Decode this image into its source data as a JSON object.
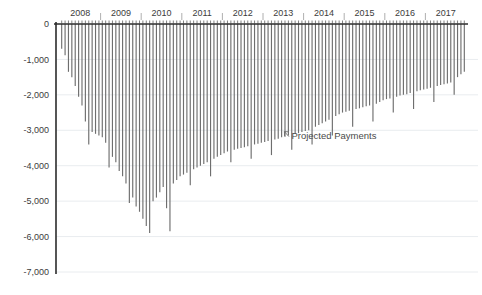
{
  "chart_data": {
    "type": "bar",
    "title": "",
    "subtitle": "",
    "xlabel": "",
    "ylabel": "",
    "orientation": "vertical",
    "grid": true,
    "grid_axis": "y",
    "legend": "none",
    "ylim": [
      -7000,
      0
    ],
    "y_ticks": [
      0,
      -1000,
      -2000,
      -3000,
      -4000,
      -5000,
      -6000,
      -7000
    ],
    "y_tick_labels": [
      "0",
      "-1,000",
      "-2,000",
      "-3,000",
      "-4,000",
      "-5,000",
      "-6,000",
      "-7,000"
    ],
    "x_tick_labels": [
      "2008",
      "2009",
      "2010",
      "2011",
      "2012",
      "2013",
      "2014",
      "2015",
      "2016",
      "2017"
    ],
    "x_minor_ticks_per_year": 12,
    "series_name": "Payments",
    "bar_color": "#7a7a7a",
    "annotations": [
      {
        "text": "Projected Payments",
        "marker": "arrow-up-left",
        "x_value": 2013.6,
        "y_value": -3150
      }
    ],
    "categories": [
      "2008-01",
      "2008-02",
      "2008-03",
      "2008-04",
      "2008-05",
      "2008-06",
      "2008-07",
      "2008-08",
      "2008-09",
      "2008-10",
      "2008-11",
      "2008-12",
      "2009-01",
      "2009-02",
      "2009-03",
      "2009-04",
      "2009-05",
      "2009-06",
      "2009-07",
      "2009-08",
      "2009-09",
      "2009-10",
      "2009-11",
      "2009-12",
      "2010-01",
      "2010-02",
      "2010-03",
      "2010-04",
      "2010-05",
      "2010-06",
      "2010-07",
      "2010-08",
      "2010-09",
      "2010-10",
      "2010-11",
      "2010-12",
      "2011-01",
      "2011-02",
      "2011-03",
      "2011-04",
      "2011-05",
      "2011-06",
      "2011-07",
      "2011-08",
      "2011-09",
      "2011-10",
      "2011-11",
      "2011-12",
      "2012-01",
      "2012-02",
      "2012-03",
      "2012-04",
      "2012-05",
      "2012-06",
      "2012-07",
      "2012-08",
      "2012-09",
      "2012-10",
      "2012-11",
      "2012-12",
      "2013-01",
      "2013-02",
      "2013-03",
      "2013-04",
      "2013-05",
      "2013-06",
      "2013-07",
      "2013-08",
      "2013-09",
      "2013-10",
      "2013-11",
      "2013-12",
      "2014-01",
      "2014-02",
      "2014-03",
      "2014-04",
      "2014-05",
      "2014-06",
      "2014-07",
      "2014-08",
      "2014-09",
      "2014-10",
      "2014-11",
      "2014-12",
      "2015-01",
      "2015-02",
      "2015-03",
      "2015-04",
      "2015-05",
      "2015-06",
      "2015-07",
      "2015-08",
      "2015-09",
      "2015-10",
      "2015-11",
      "2015-12",
      "2016-01",
      "2016-02",
      "2016-03",
      "2016-04",
      "2016-05",
      "2016-06",
      "2016-07",
      "2016-08",
      "2016-09",
      "2016-10",
      "2016-11",
      "2016-12",
      "2017-01",
      "2017-02",
      "2017-03",
      "2017-04",
      "2017-05",
      "2017-06",
      "2017-07",
      "2017-08",
      "2017-09",
      "2017-10",
      "2017-11",
      "2017-12"
    ],
    "values": [
      -700,
      -880,
      -1350,
      -1500,
      -1750,
      -2050,
      -2300,
      -2750,
      -2950,
      -3050,
      -3100,
      -3150,
      -3200,
      -3350,
      -3600,
      -3750,
      -3900,
      -4150,
      -4300,
      -4500,
      -4700,
      -4900,
      -5150,
      -5300,
      -5500,
      -5700,
      -5900,
      -5000,
      -4900,
      -4750,
      -4600,
      -5200,
      -5850,
      -4500,
      -4400,
      -4300,
      -4250,
      -4200,
      -4150,
      -4100,
      -4050,
      -4000,
      -3950,
      -3900,
      -3850,
      -3800,
      -3750,
      -3700,
      -3650,
      -3600,
      -3580,
      -3550,
      -3520,
      -3500,
      -3480,
      -3450,
      -3420,
      -3400,
      -3380,
      -3350,
      -3330,
      -3300,
      -3280,
      -3260,
      -3240,
      -3200,
      -3180,
      -3150,
      -3120,
      -3100,
      -3080,
      -3050,
      -3020,
      -3000,
      -2950,
      -2900,
      -2850,
      -2800,
      -2750,
      -2700,
      -2650,
      -2600,
      -2550,
      -2500,
      -2480,
      -2450,
      -2420,
      -2400,
      -2380,
      -2350,
      -2320,
      -2300,
      -2280,
      -2250,
      -2200,
      -2150,
      -2120,
      -2100,
      -2080,
      -2050,
      -2020,
      -2000,
      -1980,
      -1950,
      -1920,
      -1900,
      -1870,
      -1850,
      -1830,
      -1800,
      -1780,
      -1750,
      -1720,
      -1700,
      -1680,
      -1650,
      -1600,
      -1500,
      -1420,
      -1350
    ],
    "seasonal_dips": [
      {
        "index": 8,
        "value": -3400
      },
      {
        "index": 14,
        "value": -4050
      },
      {
        "index": 20,
        "value": -5050
      },
      {
        "index": 26,
        "value": -5900
      },
      {
        "index": 32,
        "value": -5850
      },
      {
        "index": 38,
        "value": -4550
      },
      {
        "index": 44,
        "value": -4300
      },
      {
        "index": 50,
        "value": -3900
      },
      {
        "index": 56,
        "value": -3800
      },
      {
        "index": 62,
        "value": -3700
      },
      {
        "index": 68,
        "value": -3550
      },
      {
        "index": 74,
        "value": -3400
      },
      {
        "index": 80,
        "value": -3150
      },
      {
        "index": 86,
        "value": -2900
      },
      {
        "index": 92,
        "value": -2750
      },
      {
        "index": 98,
        "value": -2500
      },
      {
        "index": 104,
        "value": -2400
      },
      {
        "index": 110,
        "value": -2200
      },
      {
        "index": 116,
        "value": -2000
      }
    ]
  }
}
